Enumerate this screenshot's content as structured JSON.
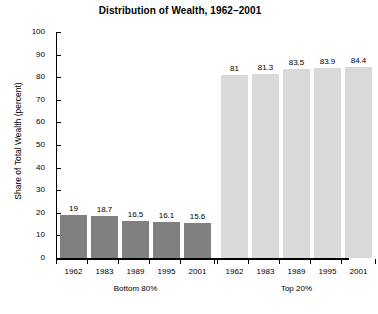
{
  "chart_data": {
    "type": "bar",
    "title": "Distribution of Wealth, 1962–2001",
    "xlabel": "",
    "ylabel": "Share of Total Wealth (percent)",
    "ylim": [
      0,
      100
    ],
    "ytick_step": 10,
    "yticks": [
      100,
      90,
      80,
      70,
      60,
      50,
      40,
      30,
      20,
      10,
      0
    ],
    "grid": false,
    "legend": "none",
    "categories": [
      "1962",
      "1983",
      "1989",
      "1995",
      "2001",
      "1962",
      "1983",
      "1989",
      "1995",
      "2001"
    ],
    "values": [
      19,
      18.7,
      16.5,
      16.1,
      15.6,
      81,
      81.3,
      83.5,
      83.9,
      84.4
    ],
    "value_labels": [
      "19",
      "18.7",
      "16.5",
      "16.1",
      "15.6",
      "81",
      "81.3",
      "83.5",
      "83.9",
      "84.4"
    ],
    "groups": [
      {
        "label": "Bottom 80%",
        "color": "#808080",
        "categories": [
          "1962",
          "1983",
          "1989",
          "1995",
          "2001"
        ],
        "values": [
          19,
          18.7,
          16.5,
          16.1,
          15.6
        ]
      },
      {
        "label": "Top 20%",
        "color": "#d9d9d9",
        "categories": [
          "1962",
          "1983",
          "1989",
          "1995",
          "2001"
        ],
        "values": [
          81,
          81.3,
          83.5,
          83.9,
          84.4
        ]
      }
    ]
  },
  "colors": {
    "bottom_80_bar": "#808080",
    "top_20_bar": "#d9d9d9",
    "axis": "#000000",
    "background": "#ffffff"
  }
}
